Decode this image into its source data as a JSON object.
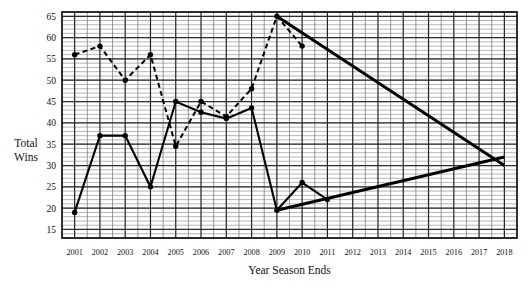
{
  "chart_data": {
    "type": "line",
    "title": "",
    "xlabel": "Year Season Ends",
    "ylabel": "Total Wins",
    "ylabel_lines": [
      "Total",
      "Wins"
    ],
    "categories": [
      2001,
      2002,
      2003,
      2004,
      2005,
      2006,
      2007,
      2008,
      2009,
      2010,
      2011,
      2012,
      2013,
      2014,
      2015,
      2016,
      2017,
      2018
    ],
    "xlim": [
      2000.5,
      2018.5
    ],
    "ylim": [
      13,
      66
    ],
    "yticks": [
      15,
      20,
      25,
      30,
      35,
      40,
      45,
      50,
      55,
      60,
      65
    ],
    "ytick_labels": [
      "15",
      "20",
      "25",
      "30",
      "35",
      "40",
      "45",
      "50",
      "55",
      "60",
      "65"
    ],
    "xtick_labels": [
      "2001",
      "2002",
      "2003",
      "2004",
      "2005",
      "2006",
      "2007",
      "2008",
      "2009",
      "2010",
      "2011",
      "2012",
      "2013",
      "2014",
      "2015",
      "2016",
      "2017",
      "2018"
    ],
    "grid": true,
    "grid_minor_step": 1,
    "grid_major_step": 5,
    "legend": "none",
    "series": [
      {
        "name": "solid-series",
        "style": "solid",
        "markers": true,
        "x": [
          2001,
          2002,
          2003,
          2004,
          2005,
          2006,
          2007,
          2008,
          2009,
          2010,
          2011
        ],
        "values": [
          19,
          37,
          37,
          25,
          45,
          42.5,
          41,
          43.5,
          19.5,
          26,
          22
        ]
      },
      {
        "name": "dashed-series",
        "style": "dashed",
        "markers": true,
        "x": [
          2001,
          2002,
          2003,
          2004,
          2005,
          2006,
          2007,
          2008,
          2009,
          2010
        ],
        "values": [
          56,
          58,
          50,
          56,
          34.5,
          45,
          41.5,
          48,
          65,
          58
        ]
      },
      {
        "name": "declining-trend-line",
        "style": "thick-solid",
        "markers": false,
        "x": [
          2009,
          2018
        ],
        "values": [
          65,
          30
        ]
      },
      {
        "name": "rising-trend-line",
        "style": "thick-solid",
        "markers": false,
        "x": [
          2009,
          2018
        ],
        "values": [
          19.5,
          32
        ]
      }
    ],
    "annotations": []
  },
  "axis": {
    "y_title_line1": "Total",
    "y_title_line2": "Wins",
    "x_title": "Year Season Ends"
  }
}
